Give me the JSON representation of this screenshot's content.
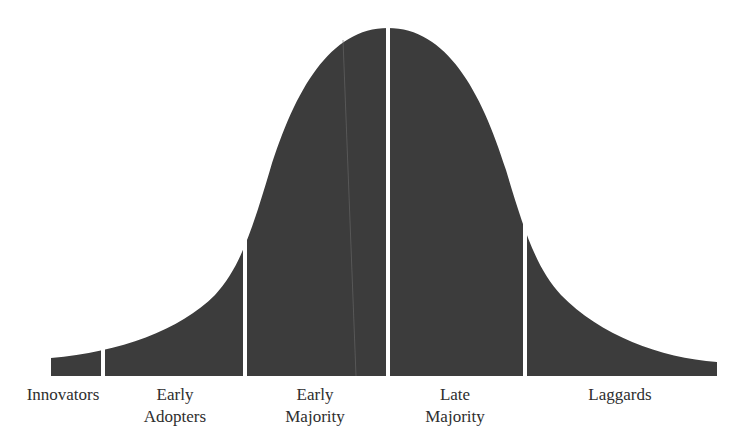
{
  "diagram": {
    "type": "bell-curve-segmented",
    "fill_color": "#3c3c3c",
    "divider_color": "#ffffff",
    "segments": [
      {
        "id": "innovators",
        "label_lines": [
          "Innovators"
        ]
      },
      {
        "id": "early-adopters",
        "label_lines": [
          "Early",
          "Adopters"
        ]
      },
      {
        "id": "early-majority",
        "label_lines": [
          "Early",
          "Majority"
        ]
      },
      {
        "id": "late-majority",
        "label_lines": [
          "Late",
          "Majority"
        ]
      },
      {
        "id": "laggards",
        "label_lines": [
          "Laggards"
        ]
      }
    ]
  },
  "labels": {
    "innovators": "Innovators",
    "early_adopters_1": "Early",
    "early_adopters_2": "Adopters",
    "early_majority_1": "Early",
    "early_majority_2": "Majority",
    "late_majority_1": "Late",
    "late_majority_2": "Majority",
    "laggards": "Laggards"
  }
}
